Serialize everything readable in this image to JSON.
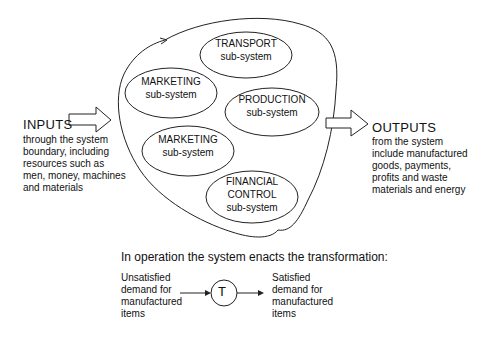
{
  "inputs": {
    "heading": "INPUTS",
    "lines": [
      "through the system",
      "boundary, including",
      "resources such as",
      "men, money, machines",
      "and materials"
    ]
  },
  "outputs": {
    "heading": "OUTPUTS",
    "lines": [
      "from the system",
      "include manufactured",
      "goods, payments,",
      "profits and waste",
      "materials and energy"
    ]
  },
  "subsystems": [
    {
      "name": "TRANSPORT",
      "label": "sub-system"
    },
    {
      "name": "MARKETING",
      "label": "sub-system"
    },
    {
      "name": "PRODUCTION",
      "label": "sub-system"
    },
    {
      "name": "MARKETING",
      "label": "sub-system"
    },
    {
      "name_line1": "FINANCIAL",
      "name_line2": "CONTROL",
      "label": "sub-system"
    }
  ],
  "transformation": {
    "caption": "In operation the system enacts the transformation:",
    "symbol": "T",
    "from_lines": [
      "Unsatisfied",
      "demand for",
      "manufactured",
      "items"
    ],
    "to_lines": [
      "Satisfied",
      "demand for",
      "manufactured",
      "items"
    ]
  }
}
